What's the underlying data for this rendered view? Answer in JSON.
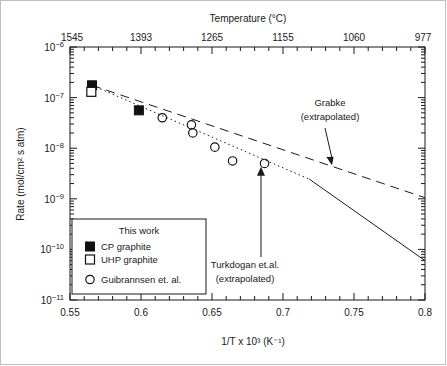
{
  "chart_data": {
    "type": "scatter",
    "title": "",
    "xlabel": "1/T x 10³ (K⁻¹)",
    "ylabel": "Rate (mol/cm² s atm)",
    "xlim": [
      0.55,
      0.8
    ],
    "ylim_exponent": [
      -11,
      -6
    ],
    "yscale": "log",
    "grid": false,
    "legend_position": "lower-left-inside",
    "x_ticks": [
      "0.55",
      "0.6",
      "0.65",
      "0.7",
      "0.75",
      "0.8"
    ],
    "x_tick_values": [
      0.55,
      0.6,
      0.65,
      0.7,
      0.75,
      0.8
    ],
    "y_ticks": [
      "10⁻⁶",
      "10⁻⁷",
      "10⁻⁸",
      "10⁻⁹",
      "10⁻¹⁰",
      "10⁻¹¹"
    ],
    "y_tick_exponents": [
      -6,
      -7,
      -8,
      -9,
      -10,
      -11
    ],
    "top_axis": {
      "label": "Temperature (°C)",
      "ticks": [
        "1545",
        "1393",
        "1265",
        "1155",
        "1060",
        "977"
      ],
      "tick_x_values": [
        0.55,
        0.6,
        0.65,
        0.7,
        0.75,
        0.8
      ]
    },
    "series": [
      {
        "name": "CP graphite",
        "marker": "filled-square",
        "points": [
          {
            "x": 0.5655,
            "y": 1.75e-07
          },
          {
            "x": 0.5985,
            "y": 5.6e-08
          }
        ]
      },
      {
        "name": "UHP graphite",
        "marker": "open-square",
        "points": [
          {
            "x": 0.565,
            "y": 1.3e-07
          }
        ]
      },
      {
        "name": "Guibrannsen et. al.",
        "marker": "open-circle",
        "points": [
          {
            "x": 0.615,
            "y": 4e-08
          },
          {
            "x": 0.6355,
            "y": 2.9e-08
          },
          {
            "x": 0.6365,
            "y": 2e-08
          },
          {
            "x": 0.652,
            "y": 1.05e-08
          },
          {
            "x": 0.6645,
            "y": 5.6e-09
          },
          {
            "x": 0.687,
            "y": 5e-09
          }
        ]
      }
    ],
    "lines": [
      {
        "name": "Grabke (extrapolated)",
        "style": "dashed",
        "from": {
          "x": 0.5655,
          "y": 1.75e-07
        },
        "to": {
          "x": 0.8,
          "y": 1.05e-09
        }
      },
      {
        "name": "Turkdogan et.al. (extrapolated) dotted segment",
        "style": "dotted",
        "from": {
          "x": 0.5655,
          "y": 1.75e-07
        },
        "to": {
          "x": 0.7185,
          "y": 2.45e-09
        }
      },
      {
        "name": "Turkdogan et.al. solid segment",
        "style": "solid",
        "from": {
          "x": 0.7185,
          "y": 2.45e-09
        },
        "to": {
          "x": 0.8,
          "y": 6e-11
        }
      }
    ],
    "annotations": [
      {
        "name": "grabke-annotation",
        "line1": "Grabke",
        "line2": "(extrapolated)",
        "target": {
          "x": 0.7345,
          "y": 4.6e-09
        }
      },
      {
        "name": "turkdogan-annotation",
        "line1": "Turkdogan et.al.",
        "line2": "(extrapolated)",
        "target": {
          "x": 0.6845,
          "y": 4.3e-09
        }
      }
    ],
    "legend": {
      "title": "This work",
      "entries": [
        {
          "label": "CP graphite",
          "marker": "filled-square"
        },
        {
          "label": "UHP graphite",
          "marker": "open-square"
        },
        {
          "label": "Guibrannsen et. al.",
          "marker": "open-circle"
        }
      ]
    }
  },
  "colors": {
    "ink": "#1a1a1a",
    "axis": "#1a1a1a",
    "frame_border": "#bfbfbf",
    "background": "#ffffff"
  }
}
